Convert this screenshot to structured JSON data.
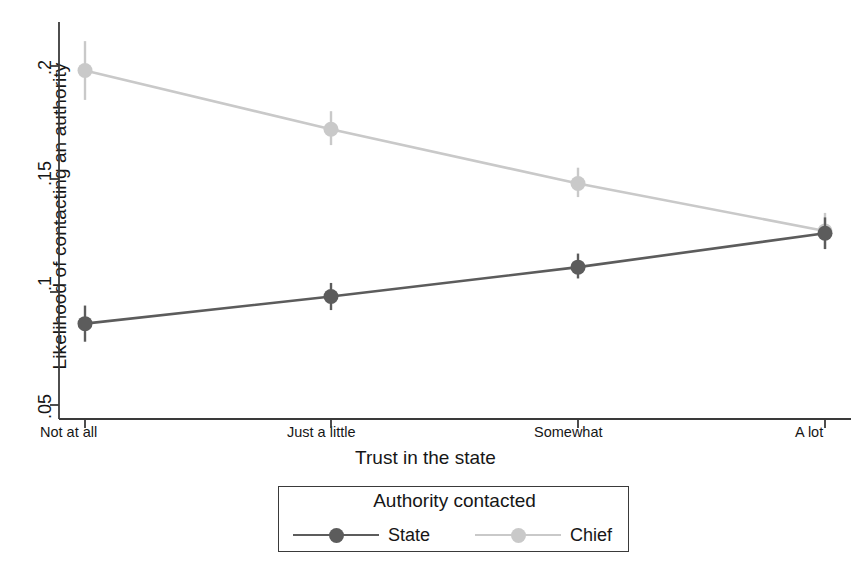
{
  "chart_data": {
    "type": "line",
    "title": "",
    "xlabel": "Trust in the state",
    "ylabel": "Likelihood of contacting an authority",
    "categories": [
      "Not at all",
      "Just a little",
      "Somewhat",
      "A lot"
    ],
    "yticks": [
      ".05",
      ".1",
      ".15",
      ".2"
    ],
    "ytick_values": [
      0.05,
      0.1,
      0.15,
      0.2
    ],
    "ylim": [
      0.04,
      0.213
    ],
    "grid": false,
    "legend_position": "below-center",
    "legend_title": "Authority contacted",
    "error_bars": true,
    "series": [
      {
        "name": "State",
        "color": "#5c5c5c",
        "values": [
          0.086,
          0.098,
          0.111,
          0.126
        ],
        "err_low": [
          0.078,
          0.092,
          0.106,
          0.119
        ],
        "err_high": [
          0.094,
          0.104,
          0.117,
          0.133
        ]
      },
      {
        "name": "Chief",
        "color": "#c9c9c9",
        "values": [
          0.198,
          0.172,
          0.148,
          0.127
        ],
        "err_low": [
          0.185,
          0.165,
          0.142,
          0.119
        ],
        "err_high": [
          0.211,
          0.18,
          0.155,
          0.135
        ]
      }
    ]
  },
  "axis": {
    "ytick_labels": [
      ".2",
      ".15",
      ".1",
      ".05"
    ],
    "xtick_labels": [
      "Not at all",
      "Just a little",
      "Somewhat",
      "A lot"
    ],
    "x_title": "Trust in the state",
    "y_title": "Likelihood of contacting an authority"
  },
  "legend": {
    "title": "Authority contacted",
    "items": [
      {
        "label": "State",
        "color": "#5c5c5c"
      },
      {
        "label": "Chief",
        "color": "#c9c9c9"
      }
    ]
  }
}
